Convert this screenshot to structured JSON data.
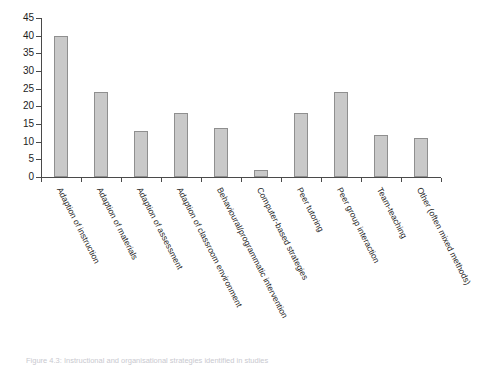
{
  "figure": {
    "caption": "Figure 4.3: Instructional and organisational strategies identified in studies"
  },
  "chart_data": {
    "type": "bar",
    "title": "",
    "subtitle": "",
    "xlabel": "",
    "ylabel": "",
    "ylim": [
      0,
      45
    ],
    "ytick_step": 5,
    "grid": false,
    "legend": "none",
    "bar_fill_color": "#c9c9c9",
    "bar_border_color": "#8f8f8f",
    "axis_color": "#4a4a4a",
    "categories": [
      "Adaption of instruction",
      "Adaption of materials",
      "Adaption of assessment",
      "Adaption of classroom environment",
      "Behavioural/programmatic intervention",
      "Computer-based strategies",
      "Peer tutoring",
      "Peer group interaction",
      "Team-teaching",
      "Other (often mixed methods)"
    ],
    "values": [
      40,
      24,
      13,
      18,
      14,
      2,
      18,
      24,
      12,
      11
    ],
    "yticks": [
      0,
      5,
      10,
      15,
      20,
      25,
      30,
      35,
      40,
      45
    ],
    "ytick_labels": [
      "0",
      "5",
      "10",
      "15",
      "20",
      "25",
      "30",
      "35",
      "40",
      "45"
    ]
  }
}
